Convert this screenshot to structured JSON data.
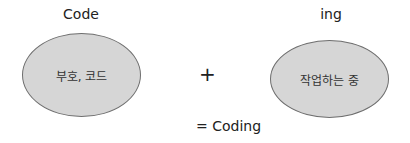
{
  "diagram": {
    "left": {
      "title": "Code",
      "content": "부호, 코드"
    },
    "operator": "+",
    "right": {
      "title": "ing",
      "content": "작업하는 중"
    },
    "result": "= Coding"
  },
  "colors": {
    "ellipse_fill": "#d6d6d6",
    "ellipse_stroke": "#6e6e6e"
  }
}
